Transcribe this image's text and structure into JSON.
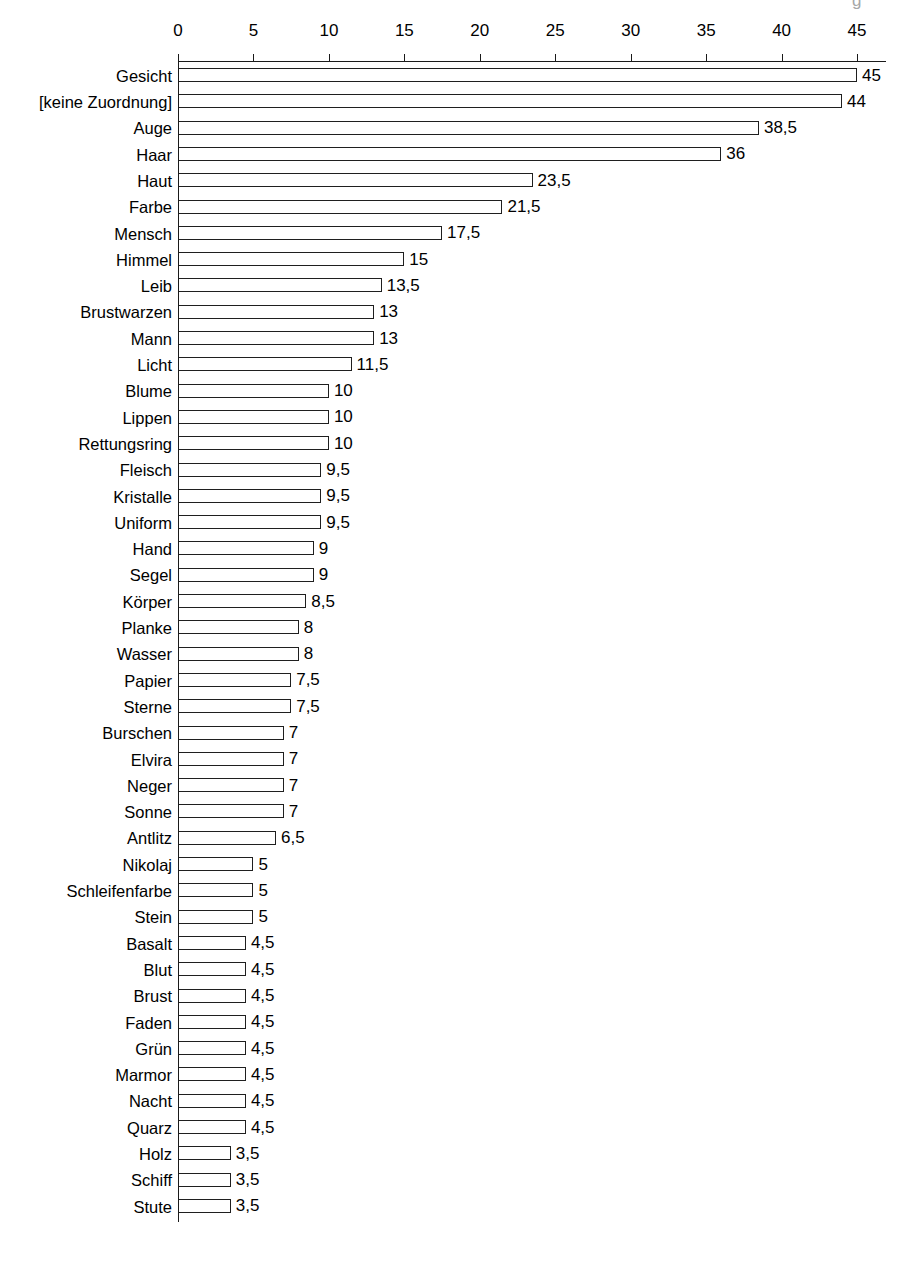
{
  "artifact": {
    "top_right_mark": "g"
  },
  "chart_data": {
    "type": "bar",
    "orientation": "horizontal",
    "title": "",
    "subtitle": "",
    "xlabel": "",
    "ylabel": "",
    "xlim": [
      0,
      45
    ],
    "xticks": [
      0,
      5,
      10,
      15,
      20,
      25,
      30,
      35,
      40,
      45
    ],
    "xtick_labels": [
      "0",
      "5",
      "10",
      "15",
      "20",
      "25",
      "30",
      "35",
      "40",
      "45"
    ],
    "grid": false,
    "legend": null,
    "decimal_separator": ",",
    "bar_style": {
      "fill": "#ffffff",
      "stroke": "#1f1f1f"
    },
    "categories": [
      "Gesicht",
      "[keine Zuordnung]",
      "Auge",
      "Haar",
      "Haut",
      "Farbe",
      "Mensch",
      "Himmel",
      "Leib",
      "Brustwarzen",
      "Mann",
      "Licht",
      "Blume",
      "Lippen",
      "Rettungsring",
      "Fleisch",
      "Kristalle",
      "Uniform",
      "Hand",
      "Segel",
      "Körper",
      "Planke",
      "Wasser",
      "Papier",
      "Sterne",
      "Burschen",
      "Elvira",
      "Neger",
      "Sonne",
      "Antlitz",
      "Nikolaj",
      "Schleifenfarbe",
      "Stein",
      "Basalt",
      "Blut",
      "Brust",
      "Faden",
      "Grün",
      "Marmor",
      "Nacht",
      "Quarz",
      "Holz",
      "Schiff",
      "Stute"
    ],
    "values": [
      45,
      44,
      38.5,
      36,
      23.5,
      21.5,
      17.5,
      15,
      13.5,
      13,
      13,
      11.5,
      10,
      10,
      10,
      9.5,
      9.5,
      9.5,
      9,
      9,
      8.5,
      8,
      8,
      7.5,
      7.5,
      7,
      7,
      7,
      7,
      6.5,
      5,
      5,
      5,
      4.5,
      4.5,
      4.5,
      4.5,
      4.5,
      4.5,
      4.5,
      4.5,
      3.5,
      3.5,
      3.5
    ],
    "value_labels": [
      "45",
      "44",
      "38,5",
      "36",
      "23,5",
      "21,5",
      "17,5",
      "15",
      "13,5",
      "13",
      "13",
      "11,5",
      "10",
      "10",
      "10",
      "9,5",
      "9,5",
      "9,5",
      "9",
      "9",
      "8,5",
      "8",
      "8",
      "7,5",
      "7,5",
      "7",
      "7",
      "7",
      "7",
      "6,5",
      "5",
      "5",
      "5",
      "4,5",
      "4,5",
      "4,5",
      "4,5",
      "4,5",
      "4,5",
      "4,5",
      "4,5",
      "3,5",
      "3,5",
      "3,5"
    ]
  },
  "geometry": {
    "x_zero_px": 178,
    "px_per_unit": 15.09,
    "axis_right_px": 886,
    "axis_line_y_px": 61,
    "first_row_top_px": 62,
    "row_pitch_px": 26.3,
    "bar_height_px": 14,
    "bar_top_offset_px": 6,
    "value_gap_px": 5
  }
}
